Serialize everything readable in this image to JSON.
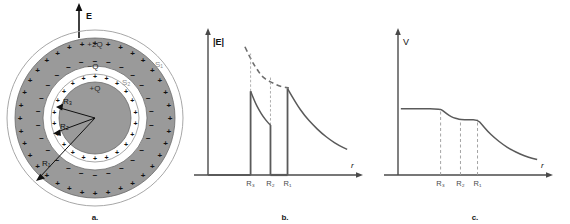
{
  "figure": {
    "panels": [
      {
        "id": "a",
        "caption": "a.",
        "type": "diagram",
        "field_arrow_label": "E",
        "charge_labels": {
          "outer_shell_outer": "+2Q",
          "outer_shell_inner": "−Q",
          "inner_sphere": "+Q"
        },
        "gaussian_surfaces": [
          {
            "name": "S1",
            "label": "S₁"
          },
          {
            "name": "S2",
            "label": "S₂"
          }
        ],
        "radius_labels": [
          {
            "name": "R1",
            "label": "R₁"
          },
          {
            "name": "R2",
            "label": "R₂"
          },
          {
            "name": "R3",
            "label": "R₃"
          }
        ],
        "colors": {
          "conductor_fill": "#9a9a9a",
          "stroke": "#4d4d4d",
          "sign_color": "#111111",
          "surface_line": "#8c8c8c"
        },
        "geometry": {
          "cx": 95,
          "cy": 118,
          "r_outer_surface": 88,
          "r_shell_outer": 80,
          "r_shell_inner": 52,
          "r_surface_s2": 44,
          "r_inner_sphere": 36
        },
        "plus_sign": "+",
        "minus_sign": "−"
      },
      {
        "id": "b",
        "caption": "b.",
        "type": "chart",
        "ylabel": "|E|",
        "xlabel": "r",
        "tick_labels": [
          "R₃",
          "R₂",
          "R₁"
        ],
        "dashed_reference_label": ""
      },
      {
        "id": "c",
        "caption": "c.",
        "type": "chart",
        "ylabel": "V",
        "xlabel": "r",
        "tick_labels": [
          "R₃",
          "R₂",
          "R₁"
        ]
      }
    ]
  },
  "chart_data": [
    {
      "type": "line",
      "panel": "b",
      "title": "",
      "xlabel": "r",
      "ylabel": "|E|",
      "xlim": [
        0,
        1
      ],
      "ylim": [
        0,
        1
      ],
      "grid": false,
      "legend": "none",
      "tick_x": [
        0.3,
        0.44,
        0.56
      ],
      "tick_labels": [
        "R₃",
        "R₂",
        "R₁"
      ],
      "annotations": [
        "E is zero for r < R3 and for R2 < r < R1"
      ],
      "series": [
        {
          "name": "E inside cavity region (r < R3)",
          "style": "solid",
          "x": [
            0.0,
            0.1,
            0.2,
            0.3
          ],
          "y": [
            0.0,
            0.0,
            0.0,
            0.0
          ]
        },
        {
          "name": "E between R3 and R2 (field of +Q)",
          "style": "solid",
          "x": [
            0.3,
            0.33,
            0.36,
            0.39,
            0.42,
            0.44
          ],
          "y": [
            0.62,
            0.54,
            0.48,
            0.43,
            0.39,
            0.37
          ]
        },
        {
          "name": "E inside conductor shell (R2 to R1)",
          "style": "solid",
          "x": [
            0.44,
            0.5,
            0.56
          ],
          "y": [
            0.0,
            0.0,
            0.0
          ]
        },
        {
          "name": "E outside shell (r > R1, field of +2Q)",
          "style": "solid",
          "x": [
            0.56,
            0.62,
            0.68,
            0.74,
            0.8,
            0.86,
            0.92,
            0.98
          ],
          "y": [
            0.64,
            0.53,
            0.44,
            0.37,
            0.31,
            0.26,
            0.22,
            0.19
          ]
        },
        {
          "name": "dashed 1/r^2 reference extrapolation",
          "style": "dashed",
          "x": [
            0.26,
            0.3,
            0.34,
            0.38,
            0.42,
            0.46,
            0.5,
            0.54,
            0.57
          ],
          "y": [
            0.95,
            0.86,
            0.79,
            0.73,
            0.7,
            0.68,
            0.66,
            0.65,
            0.645
          ]
        }
      ],
      "vertical_drop_lines": [
        {
          "at": 0.3,
          "from": 0.0,
          "to": 0.62
        },
        {
          "at": 0.44,
          "from": 0.37,
          "to": 0.0
        },
        {
          "at": 0.56,
          "from": 0.0,
          "to": 0.64
        }
      ],
      "dashed_guides": [
        {
          "at": 0.3,
          "from": 0.62,
          "to": 0.9
        },
        {
          "at": 0.44,
          "from": 0.37,
          "to": 0.73
        }
      ]
    },
    {
      "type": "line",
      "panel": "c",
      "title": "",
      "xlabel": "r",
      "ylabel": "V",
      "xlim": [
        0,
        1
      ],
      "ylim": [
        0,
        1
      ],
      "grid": false,
      "legend": "none",
      "tick_x": [
        0.3,
        0.44,
        0.56
      ],
      "tick_labels": [
        "R₃",
        "R₂",
        "R₁"
      ],
      "annotations": [
        "V constant inside conductor regions"
      ],
      "series": [
        {
          "name": "Potential V(r)",
          "style": "solid",
          "x": [
            0.02,
            0.15,
            0.3,
            0.33,
            0.36,
            0.39,
            0.42,
            0.44,
            0.5,
            0.56,
            0.59,
            0.63,
            0.68,
            0.74,
            0.8,
            0.86,
            0.92,
            0.98
          ],
          "y": [
            0.49,
            0.49,
            0.49,
            0.465,
            0.44,
            0.425,
            0.415,
            0.41,
            0.41,
            0.41,
            0.375,
            0.325,
            0.275,
            0.225,
            0.185,
            0.155,
            0.13,
            0.115
          ]
        }
      ],
      "dashed_guides": [
        {
          "at": 0.3,
          "from": 0.0,
          "to": 0.49
        },
        {
          "at": 0.44,
          "from": 0.0,
          "to": 0.41
        },
        {
          "at": 0.56,
          "from": 0.0,
          "to": 0.41
        }
      ]
    }
  ]
}
